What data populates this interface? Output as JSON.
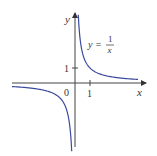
{
  "chart_data": {
    "type": "line",
    "title": "",
    "xlabel": "x",
    "ylabel": "y",
    "origin_label": "0",
    "x_ticks": [
      {
        "value": 1,
        "label": "1"
      }
    ],
    "y_ticks": [
      {
        "value": 1,
        "label": "1"
      }
    ],
    "xlim": [
      -4.2,
      4.6
    ],
    "ylim": [
      -4.3,
      4.6
    ],
    "grid": false,
    "legend": null,
    "series": [
      {
        "name": "y = 1/x",
        "equation": {
          "lhs": "y =",
          "numerator": "1",
          "denominator": "x"
        },
        "function": "1/x",
        "color": "#3b4a9c",
        "branches": [
          {
            "x": [
              0.22,
              0.3,
              0.4,
              0.5,
              0.75,
              1,
              1.5,
              2,
              3,
              4.2
            ],
            "y": [
              4.55,
              3.33,
              2.5,
              2,
              1.33,
              1,
              0.667,
              0.5,
              0.333,
              0.238
            ]
          },
          {
            "x": [
              -4.2,
              -3,
              -2,
              -1.5,
              -1,
              -0.75,
              -0.5,
              -0.4,
              -0.3,
              -0.22
            ],
            "y": [
              -0.238,
              -0.333,
              -0.5,
              -0.667,
              -1,
              -1.33,
              -2,
              -2.5,
              -3.33,
              -4.55
            ]
          }
        ]
      }
    ]
  }
}
